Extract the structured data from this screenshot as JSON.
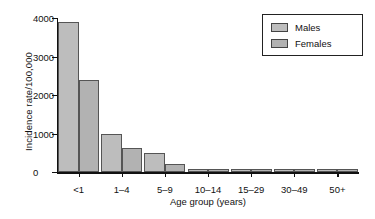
{
  "chart_data": {
    "type": "bar",
    "title": "",
    "xlabel": "Age group (years)",
    "ylabel": "Incidence rate/100,000",
    "categories": [
      "<1",
      "1–4",
      "5–9",
      "10–14",
      "15–29",
      "30–49",
      "50+"
    ],
    "series": [
      {
        "name": "Males",
        "color": "#bdbdbd",
        "values": [
          3900,
          1000,
          500,
          90,
          70,
          80,
          80
        ]
      },
      {
        "name": "Females",
        "color": "#b2b2b2",
        "values": [
          2400,
          620,
          210,
          90,
          70,
          80,
          80
        ]
      }
    ],
    "ylim": [
      0,
      4000
    ],
    "yticks": [
      0,
      1000,
      2000,
      3000,
      4000
    ],
    "ytick_labels": [
      "0",
      "1000",
      "2000",
      "3000",
      "4000"
    ],
    "grid": false,
    "legend_position": "top-right",
    "legend_entries": [
      "Males",
      "Females"
    ]
  },
  "legend": {
    "males_label": "Males",
    "females_label": "Females"
  },
  "axes": {
    "x_title": "Age group (years)",
    "y_title": "Incidence rate/100,000"
  }
}
